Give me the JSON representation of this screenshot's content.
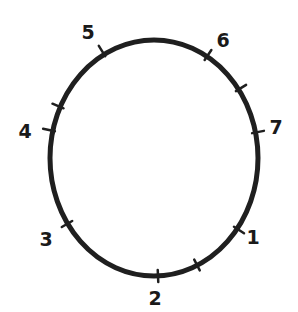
{
  "diagram": {
    "type": "hand-drawn circle with numbered tick marks",
    "stroke_color": "#1f1f1f",
    "background": "#ffffff",
    "ellipse": {
      "cx": 154,
      "cy": 158,
      "rx": 104,
      "ry": 118
    },
    "labels": [
      {
        "text": "1",
        "x": 253,
        "y": 237
      },
      {
        "text": "2",
        "x": 155,
        "y": 298
      },
      {
        "text": "3",
        "x": 46,
        "y": 239
      },
      {
        "text": "4",
        "x": 25,
        "y": 131
      },
      {
        "text": "5",
        "x": 88,
        "y": 32
      },
      {
        "text": "6",
        "x": 223,
        "y": 40
      },
      {
        "text": "7",
        "x": 276,
        "y": 127
      }
    ],
    "ticks": [
      {
        "id": "1",
        "x": 239,
        "y": 230
      },
      {
        "id": "2",
        "x": 158,
        "y": 276
      },
      {
        "id": "3",
        "x": 67,
        "y": 224
      },
      {
        "id": "4",
        "x": 49,
        "y": 130
      },
      {
        "id": "5",
        "x": 102,
        "y": 51
      },
      {
        "id": "6",
        "x": 208,
        "y": 55
      },
      {
        "id": "7",
        "x": 258,
        "y": 132
      },
      {
        "id": "minor-a",
        "x": 58,
        "y": 106
      },
      {
        "id": "minor-b",
        "x": 197,
        "y": 265
      },
      {
        "id": "minor-c",
        "x": 241,
        "y": 88
      }
    ]
  }
}
